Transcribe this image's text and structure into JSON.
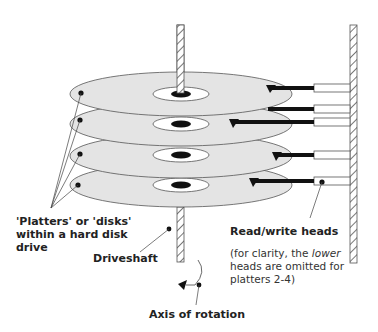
{
  "diagram": {
    "type": "hard-disk-platters-illustration",
    "labels": {
      "platters": "'Platters' or 'disks' within a hard disk drive",
      "driveshaft": "Driveshaft",
      "read_write_heads": "Read/write heads",
      "note_prefix": "(for clarity, the ",
      "note_emphasis": "lower",
      "note_suffix": " heads are omitted for platters 2-4)",
      "axis_of_rotation": "Axis of rotation"
    },
    "platter_count": 4,
    "colors": {
      "platter_fill": "#e4e4e4",
      "outline": "#555555",
      "head_arm": "#111111",
      "background": "#ffffff"
    }
  }
}
